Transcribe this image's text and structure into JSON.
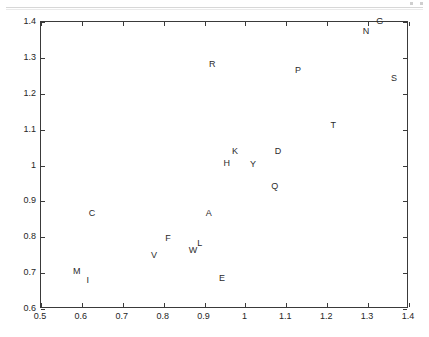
{
  "figure": {
    "background_color": "#ffffff",
    "frame_color": "#3a3a3a",
    "label_color": "#2b2b2b",
    "artifact_line_color": "#d7d7d7"
  },
  "chart_data": {
    "type": "scatter",
    "title": "",
    "subtitle": "",
    "xlabel": "",
    "ylabel": "",
    "xlim": [
      0.5,
      1.4
    ],
    "ylim": [
      0.6,
      1.4
    ],
    "xticks": [
      0.5,
      0.6,
      0.7,
      0.8,
      0.9,
      1.0,
      1.1,
      1.2,
      1.3,
      1.4
    ],
    "yticks": [
      0.6,
      0.7,
      0.8,
      0.9,
      1.0,
      1.1,
      1.2,
      1.3,
      1.4
    ],
    "xtick_labels": [
      "0.5",
      "0.6",
      "0.7",
      "0.8",
      "0.9",
      "1",
      "1.1",
      "1.2",
      "1.3",
      "1.4"
    ],
    "ytick_labels": [
      "0.6",
      "0.7",
      "0.8",
      "0.9",
      "1",
      "1.1",
      "1.2",
      "1.3",
      "1.4"
    ],
    "grid": false,
    "legend": null,
    "marker_style": "text-label",
    "annotations": [],
    "points": [
      {
        "label": "G",
        "x": 1.331,
        "y": 1.4
      },
      {
        "label": "N",
        "x": 1.297,
        "y": 1.372
      },
      {
        "label": "R",
        "x": 0.921,
        "y": 1.28
      },
      {
        "label": "P",
        "x": 1.131,
        "y": 1.264
      },
      {
        "label": "S",
        "x": 1.366,
        "y": 1.242
      },
      {
        "label": "T",
        "x": 1.217,
        "y": 1.11
      },
      {
        "label": "K",
        "x": 0.977,
        "y": 1.038
      },
      {
        "label": "D",
        "x": 1.082,
        "y": 1.038
      },
      {
        "label": "H",
        "x": 0.957,
        "y": 1.004
      },
      {
        "label": "Y",
        "x": 1.021,
        "y": 1.002
      },
      {
        "label": "Q",
        "x": 1.074,
        "y": 0.94
      },
      {
        "label": "C",
        "x": 0.627,
        "y": 0.865
      },
      {
        "label": "A",
        "x": 0.913,
        "y": 0.865
      },
      {
        "label": "F",
        "x": 0.813,
        "y": 0.795
      },
      {
        "label": "L",
        "x": 0.891,
        "y": 0.781
      },
      {
        "label": "W",
        "x": 0.874,
        "y": 0.762
      },
      {
        "label": "V",
        "x": 0.779,
        "y": 0.748
      },
      {
        "label": "M",
        "x": 0.59,
        "y": 0.703
      },
      {
        "label": "I",
        "x": 0.617,
        "y": 0.678
      },
      {
        "label": "E",
        "x": 0.945,
        "y": 0.684
      }
    ]
  }
}
